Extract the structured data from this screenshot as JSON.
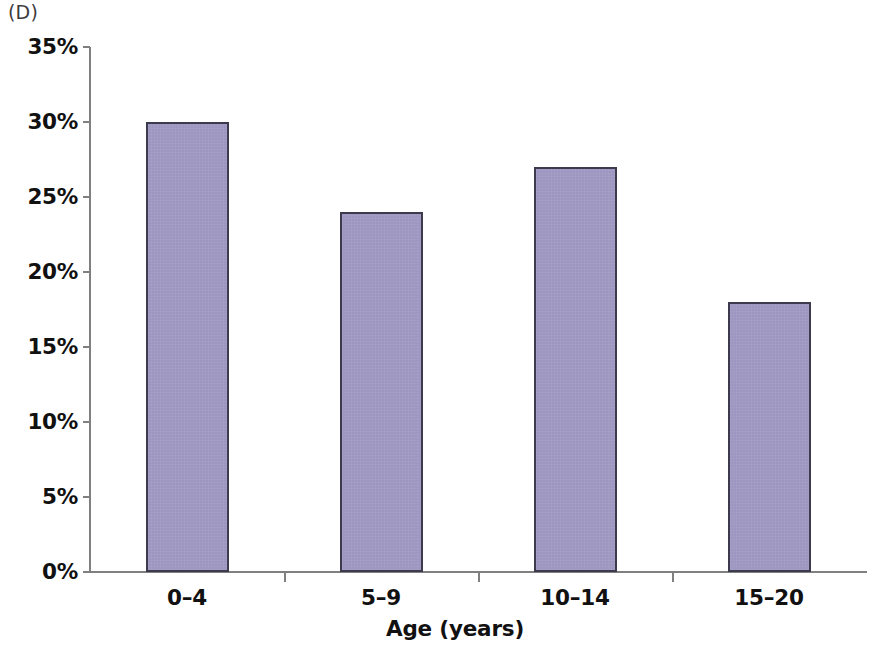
{
  "panel": {
    "label": "(D)"
  },
  "chart_data": {
    "type": "bar",
    "title": "",
    "subtitle": "",
    "panel_label": "(D)",
    "categories": [
      "0–4",
      "5–9",
      "10–14",
      "15–20"
    ],
    "values": [
      30,
      24,
      27,
      18
    ],
    "value_labels": [
      "30%",
      "24%",
      "27%",
      "18%"
    ],
    "xlabel": "Age (years)",
    "ylabel": "",
    "ylim": [
      0,
      35
    ],
    "ytick_values": [
      0,
      5,
      10,
      15,
      20,
      25,
      30,
      35
    ],
    "ytick_labels": [
      "0%",
      "5%",
      "10%",
      "15%",
      "20%",
      "25%",
      "30%",
      "35%"
    ],
    "units": "percent",
    "grid": false,
    "legend": false,
    "legend_position": "none",
    "series": [
      {
        "name": "Percentage",
        "values": [
          30,
          24,
          27,
          18
        ],
        "fill_color": "#9d96c0",
        "edge_color": "#3b3b4d"
      }
    ],
    "colors": {
      "bar_fill": "#9d96c0",
      "bar_edge": "#3b3b4d",
      "axis": "#808080",
      "text": "#111111",
      "panel_label": "#3c3c3c",
      "background": "#ffffff"
    }
  }
}
